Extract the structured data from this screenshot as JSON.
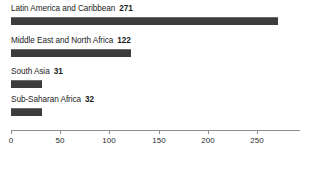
{
  "chart_data": {
    "type": "bar",
    "orientation": "horizontal",
    "title": "",
    "subtitle": "",
    "xlabel": "",
    "ylabel": "",
    "categories": [
      "Latin America and Caribbean",
      "Middle East and North Africa",
      "South Asia",
      "Sub-Saharan Africa"
    ],
    "values": [
      271,
      122,
      31,
      32
    ],
    "value_labels": [
      "271",
      "122",
      "31",
      "32"
    ],
    "xlim": [
      0,
      294
    ],
    "xticks": [
      0,
      50,
      100,
      150,
      200,
      250
    ],
    "xtick_labels": [
      "0",
      "50",
      "100",
      "150",
      "200",
      "250"
    ],
    "grid": false,
    "legend": null,
    "bar_color": "#3c3c3c",
    "axis_color": "#8e8e8e",
    "text_color": "#1c1c1c",
    "background": "#ffffff"
  },
  "bars": [
    {
      "label": "Latin America and Caribbean",
      "value_label": "271",
      "value": 271
    },
    {
      "label": "Middle East and North Africa",
      "value_label": "122",
      "value": 122
    },
    {
      "label": "South Asia",
      "value_label": "31",
      "value": 31
    },
    {
      "label": "Sub-Saharan Africa",
      "value_label": "32",
      "value": 32
    }
  ],
  "axis": {
    "ticks": [
      {
        "label": "0"
      },
      {
        "label": "50"
      },
      {
        "label": "100"
      },
      {
        "label": "150"
      },
      {
        "label": "200"
      },
      {
        "label": "250"
      }
    ]
  }
}
